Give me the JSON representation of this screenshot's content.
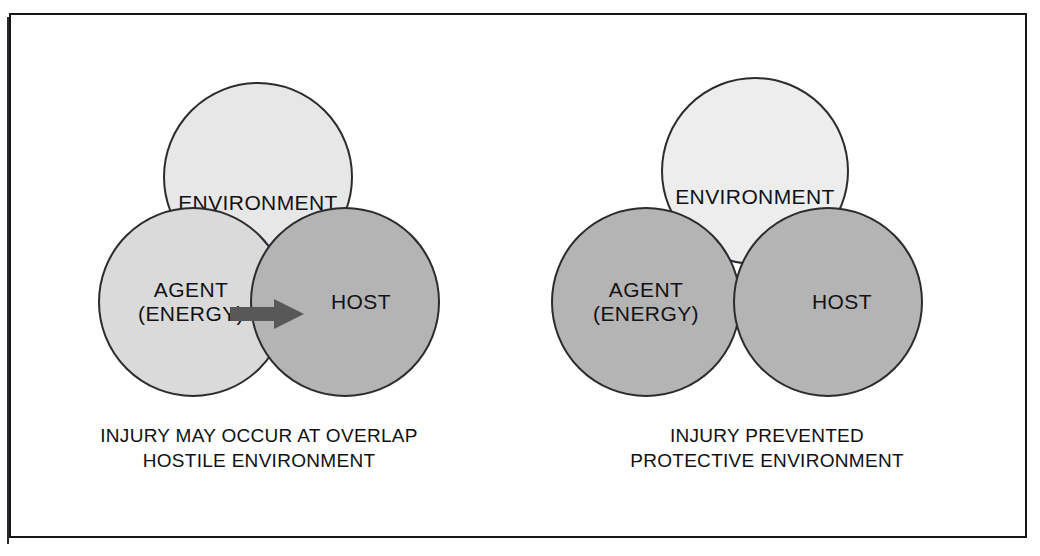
{
  "figure": {
    "type": "epidemiologic-triad-venn",
    "border_color": "#16161a",
    "background": "#ffffff",
    "panel_count": 2
  },
  "palette": {
    "environment_light": "#e7e7e7",
    "environment_lightest": "#ededed",
    "agent_light": "#dadada",
    "host_gray": "#b4b4b4",
    "agent_gray": "#b4b4b4",
    "circle_stroke": "#2b2b30",
    "arrow_fill": "#585858",
    "text": "#121214"
  },
  "panels": [
    {
      "id": "hostile",
      "circles": [
        {
          "name": "environment",
          "label": "ENVIRONMENT",
          "fill": "#e7e7e7",
          "overlaps": true
        },
        {
          "name": "agent",
          "label": "AGENT\n(ENERGY)",
          "fill": "#dadada",
          "overlaps": true
        },
        {
          "name": "host",
          "label": "HOST",
          "fill": "#b4b4b4",
          "overlaps": true
        }
      ],
      "arrow": {
        "name": "energy-transfer-arrow",
        "from": "agent",
        "to": "host",
        "direction": "right",
        "fill": "#585858"
      },
      "caption": {
        "line1": "INJURY MAY OCCUR AT OVERLAP",
        "line2": "HOSTILE ENVIRONMENT"
      }
    },
    {
      "id": "protective",
      "circles": [
        {
          "name": "environment",
          "label": "ENVIRONMENT",
          "fill": "#ededed",
          "overlaps": false
        },
        {
          "name": "agent",
          "label": "AGENT\n(ENERGY)",
          "fill": "#b4b4b4",
          "overlaps": false
        },
        {
          "name": "host",
          "label": "HOST",
          "fill": "#b4b4b4",
          "overlaps": false
        }
      ],
      "arrow": null,
      "caption": {
        "line1": "INJURY PREVENTED",
        "line2": "PROTECTIVE ENVIRONMENT"
      }
    }
  ]
}
